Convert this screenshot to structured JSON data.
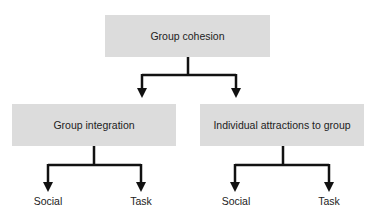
{
  "root": {
    "label": "Group cohesion"
  },
  "children": [
    {
      "label": "Group integration",
      "leaves": [
        "Social",
        "Task"
      ]
    },
    {
      "label": "Individual attractions to group",
      "leaves": [
        "Social",
        "Task"
      ]
    }
  ],
  "colors": {
    "box_fill": "#dcdcdc",
    "line": "#111111",
    "text": "#222222"
  }
}
